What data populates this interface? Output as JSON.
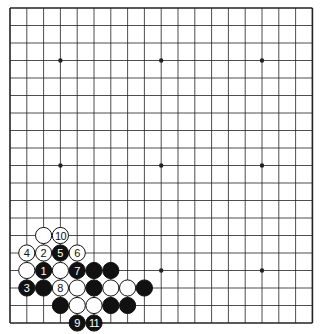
{
  "board": {
    "size": 19,
    "origin_x": 10,
    "origin_y": 8,
    "spacing_x": 16.8,
    "spacing_y": 17.5,
    "stone_radius": 8.1,
    "line_color": "#222222",
    "background": "#ffffff",
    "star_points": [
      [
        3,
        3
      ],
      [
        9,
        3
      ],
      [
        15,
        3
      ],
      [
        3,
        9
      ],
      [
        9,
        9
      ],
      [
        15,
        9
      ],
      [
        3,
        15
      ],
      [
        9,
        15
      ],
      [
        15,
        15
      ]
    ]
  },
  "colors": {
    "black_stone": "#111111",
    "white_stone": "#ffffff",
    "stone_outline": "#111111",
    "black_label": "#ffffff",
    "white_label": "#111111"
  },
  "stones": [
    {
      "color": "white",
      "col": 2,
      "row": 13,
      "label": ""
    },
    {
      "color": "white",
      "col": 3,
      "row": 13,
      "label": "10"
    },
    {
      "color": "white",
      "col": 1,
      "row": 14,
      "label": "4"
    },
    {
      "color": "white",
      "col": 2,
      "row": 14,
      "label": "2"
    },
    {
      "color": "black",
      "col": 3,
      "row": 14,
      "label": "5"
    },
    {
      "color": "white",
      "col": 4,
      "row": 14,
      "label": "6"
    },
    {
      "color": "white",
      "col": 1,
      "row": 15,
      "label": ""
    },
    {
      "color": "black",
      "col": 2,
      "row": 15,
      "label": "1"
    },
    {
      "color": "white",
      "col": 3,
      "row": 15,
      "label": ""
    },
    {
      "color": "black",
      "col": 4,
      "row": 15,
      "label": "7"
    },
    {
      "color": "black",
      "col": 5,
      "row": 15,
      "label": ""
    },
    {
      "color": "black",
      "col": 6,
      "row": 15,
      "label": ""
    },
    {
      "color": "black",
      "col": 1,
      "row": 16,
      "label": "3"
    },
    {
      "color": "black",
      "col": 2,
      "row": 16,
      "label": ""
    },
    {
      "color": "white",
      "col": 3,
      "row": 16,
      "label": "8"
    },
    {
      "color": "white",
      "col": 4,
      "row": 16,
      "label": ""
    },
    {
      "color": "black",
      "col": 5,
      "row": 16,
      "label": ""
    },
    {
      "color": "white",
      "col": 6,
      "row": 16,
      "label": ""
    },
    {
      "color": "white",
      "col": 7,
      "row": 16,
      "label": ""
    },
    {
      "color": "black",
      "col": 8,
      "row": 16,
      "label": ""
    },
    {
      "color": "black",
      "col": 3,
      "row": 17,
      "label": ""
    },
    {
      "color": "white",
      "col": 4,
      "row": 17,
      "label": ""
    },
    {
      "color": "white",
      "col": 5,
      "row": 17,
      "label": ""
    },
    {
      "color": "black",
      "col": 6,
      "row": 17,
      "label": ""
    },
    {
      "color": "black",
      "col": 7,
      "row": 17,
      "label": ""
    },
    {
      "color": "black",
      "col": 4,
      "row": 18,
      "label": "9"
    },
    {
      "color": "black",
      "col": 5,
      "row": 18,
      "label": "11"
    }
  ]
}
